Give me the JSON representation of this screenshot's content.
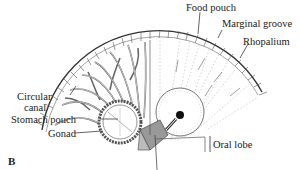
{
  "figure": {
    "panel_label": "B",
    "labels": {
      "food_pouch": "Food pouch",
      "marginal_groove": "Marginal groove",
      "rhopalium": "Rhopalium",
      "circular_canal_line1": "Circular",
      "circular_canal_line2": "canal",
      "stomach_pouch": "Stomach pouch",
      "gonad": "Gonad",
      "oral_lobe": "Oral lobe"
    }
  }
}
